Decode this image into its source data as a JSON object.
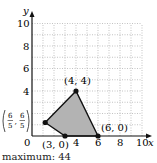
{
  "chart_data": {
    "type": "scatter",
    "title": "",
    "xlabel": "x",
    "ylabel": "y",
    "xlim": [
      0,
      10
    ],
    "ylim": [
      0,
      10
    ],
    "grid": true,
    "x_ticks": [
      "0",
      "4",
      "6",
      "8",
      "10"
    ],
    "y_ticks": [
      "6",
      "8",
      "10"
    ],
    "y_ticks_extra": [
      "4"
    ],
    "feasible_region": {
      "fill": "#b3b3b3",
      "vertices": [
        [
          1.2,
          1.2
        ],
        [
          4,
          4
        ],
        [
          6,
          0
        ],
        [
          3,
          0
        ]
      ]
    },
    "points": [
      {
        "x": 4,
        "y": 4,
        "label": "(4, 4)"
      },
      {
        "x": 6,
        "y": 0,
        "label": "(6, 0)"
      },
      {
        "x": 3,
        "y": 0,
        "label": "(3, 0)"
      },
      {
        "x": 1.2,
        "y": 1.2,
        "label": "(6/5, 6/5)",
        "label_num": "6",
        "label_den": "5"
      }
    ],
    "annotation": "maximum: 44"
  },
  "caption": "maximum: 44",
  "labels": {
    "x_axis": "x",
    "y_axis": "y",
    "origin": "0",
    "p44": "(4, 4)",
    "p60": "(6, 0)",
    "p30": "(3, 0)",
    "frac_num": "6",
    "frac_den": "5"
  },
  "ticks": {
    "x": [
      {
        "v": 4,
        "t": "4"
      },
      {
        "v": 6,
        "t": "6"
      },
      {
        "v": 8,
        "t": "8"
      },
      {
        "v": 10,
        "t": "10"
      }
    ],
    "y": [
      {
        "v": 4,
        "t": "4"
      },
      {
        "v": 6,
        "t": "6"
      },
      {
        "v": 8,
        "t": "8"
      },
      {
        "v": 10,
        "t": "10"
      }
    ]
  }
}
